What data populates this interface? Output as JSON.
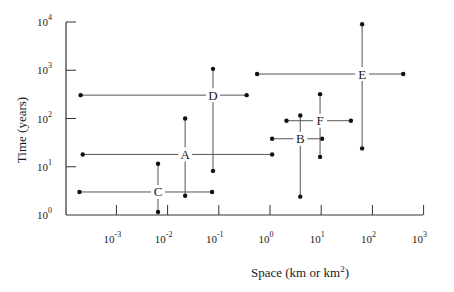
{
  "chart_data": {
    "type": "scatter",
    "subtype": "log-log cross/range plot",
    "title": "",
    "xlabel": "Space (km or km2)",
    "xlabel_parts": {
      "base": "Space (km or km",
      "sup": "2",
      "tail": ")"
    },
    "ylabel": "Time (years)",
    "x_scale": "log",
    "y_scale": "log",
    "xlim": [
      0.0001,
      1000
    ],
    "ylim": [
      1,
      10000
    ],
    "grid": false,
    "legend": null,
    "x_ticks": [
      {
        "exp": "-3",
        "value": 0.001
      },
      {
        "exp": "-2",
        "value": 0.01
      },
      {
        "exp": "-1",
        "value": 0.1
      },
      {
        "exp": "0",
        "value": 1
      },
      {
        "exp": "1",
        "value": 10
      },
      {
        "exp": "2",
        "value": 100
      },
      {
        "exp": "3",
        "value": 1000
      }
    ],
    "y_ticks": [
      {
        "exp": "0",
        "value": 1
      },
      {
        "exp": "1",
        "value": 10
      },
      {
        "exp": "2",
        "value": 100
      },
      {
        "exp": "3",
        "value": 1000
      },
      {
        "exp": "4",
        "value": 10000
      }
    ],
    "series": [
      {
        "name": "A",
        "center": {
          "x": 0.022,
          "y": 18
        },
        "x_range": [
          0.00022,
          1.1
        ],
        "y_range": [
          2.5,
          100
        ]
      },
      {
        "name": "B",
        "center": {
          "x": 3.9,
          "y": 38
        },
        "x_range": [
          1.1,
          10.4
        ],
        "y_range": [
          2.4,
          115
        ]
      },
      {
        "name": "C",
        "center": {
          "x": 0.0065,
          "y": 3
        },
        "x_range": [
          0.00019,
          0.074
        ],
        "y_range": [
          1.15,
          11.5
        ]
      },
      {
        "name": "D",
        "center": {
          "x": 0.077,
          "y": 305
        },
        "x_range": [
          0.0002,
          0.35
        ],
        "y_range": [
          8.2,
          1070
        ]
      },
      {
        "name": "E",
        "center": {
          "x": 63,
          "y": 835
        },
        "x_range": [
          0.56,
          400
        ],
        "y_range": [
          24,
          9000
        ]
      },
      {
        "name": "F",
        "center": {
          "x": 9.5,
          "y": 90
        },
        "x_range": [
          2.1,
          38
        ],
        "y_range": [
          16,
          320
        ]
      }
    ]
  },
  "axes": {
    "x_tick_base": "10",
    "y_tick_base": "10"
  }
}
